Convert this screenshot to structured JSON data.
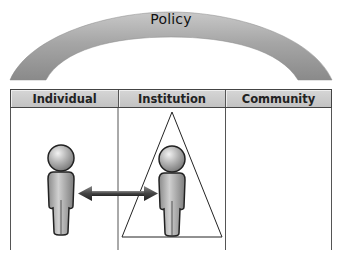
{
  "title": "Policy",
  "columns": [
    {
      "label": "Individual"
    },
    {
      "label": "Institution"
    },
    {
      "label": "Community"
    }
  ],
  "figures": [
    {
      "name": "individual-person",
      "column": "Individual"
    },
    {
      "name": "institution-person",
      "column": "Institution",
      "enclosed_by": "triangle"
    }
  ],
  "connector": {
    "type": "double-headed-arrow",
    "from": "individual-person",
    "to": "institution-person"
  },
  "colors": {
    "arch": "#9a9a9a",
    "header_fill": "#cccccc",
    "lines": "#555555",
    "figure": "#a8a8a8"
  }
}
